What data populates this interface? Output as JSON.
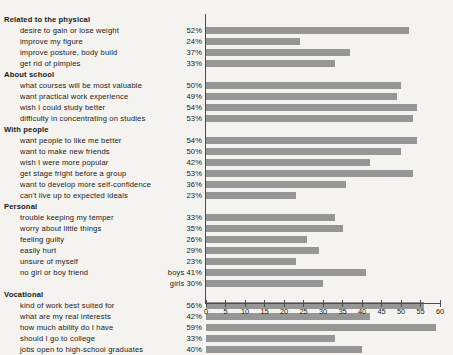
{
  "chart_data": {
    "type": "bar",
    "orientation": "horizontal",
    "title": "",
    "xlabel": "",
    "ylabel": "",
    "xlim": [
      0,
      60
    ],
    "xticks": [
      0,
      5,
      10,
      15,
      20,
      25,
      30,
      35,
      40,
      45,
      50,
      55,
      60
    ],
    "grid": false,
    "legend": "none",
    "bar_color": "#969696",
    "axis_color": "#4a4a4a",
    "background": "#f5f3ef",
    "sections": [
      {
        "name": "Related to the physical",
        "items": [
          {
            "label": "desire to gain or lose weight",
            "value": 52,
            "value_label": "52%"
          },
          {
            "label": "improve my figure",
            "value": 24,
            "value_label": "24%"
          },
          {
            "label": "improve posture, body build",
            "value": 37,
            "value_label": "37%"
          },
          {
            "label": "get rid of pimples",
            "value": 33,
            "value_label": "33%"
          }
        ]
      },
      {
        "name": "About school",
        "items": [
          {
            "label": "what courses will be most valuable",
            "value": 50,
            "value_label": "50%"
          },
          {
            "label": "want practical work experience",
            "value": 49,
            "value_label": "49%"
          },
          {
            "label": "wish I could study better",
            "value": 54,
            "value_label": "54%"
          },
          {
            "label": "difficulty in concentrating on studies",
            "value": 53,
            "value_label": "53%"
          }
        ]
      },
      {
        "name": "With people",
        "items": [
          {
            "label": "want people to like me better",
            "value": 54,
            "value_label": "54%"
          },
          {
            "label": "want to make new friends",
            "value": 50,
            "value_label": "50%"
          },
          {
            "label": "wish I were more popular",
            "value": 42,
            "value_label": "42%"
          },
          {
            "label": "get stage fright before a group",
            "value": 53,
            "value_label": "53%"
          },
          {
            "label": "want to develop more self-confidence",
            "value": 36,
            "value_label": "36%"
          },
          {
            "label": "can't live up to expected ideals",
            "value": 23,
            "value_label": "23%"
          }
        ]
      },
      {
        "name": "Personal",
        "items": [
          {
            "label": "trouble keeping my temper",
            "value": 33,
            "value_label": "33%"
          },
          {
            "label": "worry about little things",
            "value": 35,
            "value_label": "35%"
          },
          {
            "label": "feeling guilty",
            "value": 26,
            "value_label": "26%"
          },
          {
            "label": "easily hurt",
            "value": 29,
            "value_label": "29%"
          },
          {
            "label": "unsure of myself",
            "value": 23,
            "value_label": "23%"
          },
          {
            "label": "no girl or boy friend",
            "value": 41,
            "value_label": "boys 41%"
          },
          {
            "label": "",
            "value": 30,
            "value_label": "girls 30%"
          }
        ]
      },
      {
        "name": "Vocational",
        "items": [
          {
            "label": "kind of work best suited for",
            "value": 56,
            "value_label": "56%"
          },
          {
            "label": "what are my real interests",
            "value": 42,
            "value_label": "42%"
          },
          {
            "label": "how much ability do I have",
            "value": 59,
            "value_label": "59%"
          },
          {
            "label": "should I go to college",
            "value": 33,
            "value_label": "33%"
          },
          {
            "label": "jobs open to high-school graduates",
            "value": 40,
            "value_label": "40%"
          }
        ]
      }
    ]
  }
}
